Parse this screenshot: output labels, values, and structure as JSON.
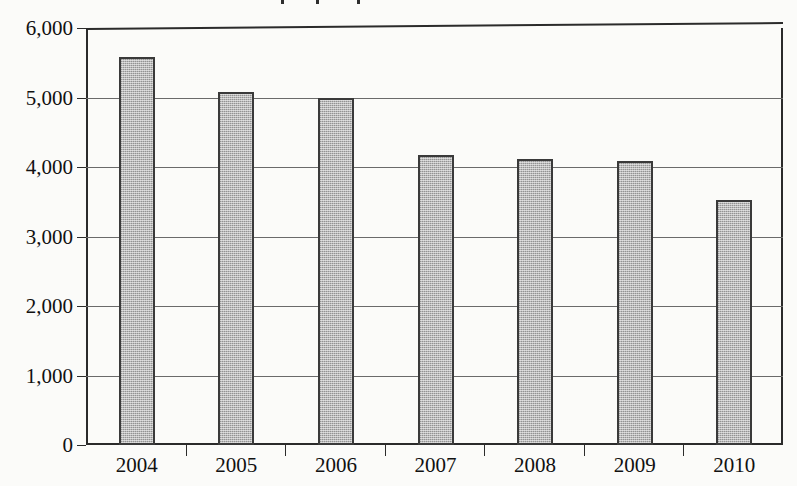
{
  "chart_data": {
    "type": "bar",
    "title": "",
    "title_note": "chart title is cropped off the top edge of the image; only ink specks from descenders remain",
    "xlabel": "",
    "ylabel": "",
    "categories": [
      "2004",
      "2005",
      "2006",
      "2007",
      "2008",
      "2009",
      "2010"
    ],
    "values": [
      5580,
      5080,
      5000,
      4180,
      4120,
      4090,
      3520
    ],
    "ylim": [
      0,
      6000
    ],
    "ytick_labels": [
      "0",
      "1,000",
      "2,000",
      "3,000",
      "4,000",
      "5,000",
      "6,000"
    ],
    "ytick_values": [
      0,
      1000,
      2000,
      3000,
      4000,
      5000,
      6000
    ],
    "grid": true,
    "grid_axis": "y",
    "legend": false,
    "bar_fill": "#b9b9b9",
    "bar_border": "#3a3a3a",
    "background": "#fbfbf9",
    "axis_color": "#2b2b2b"
  }
}
